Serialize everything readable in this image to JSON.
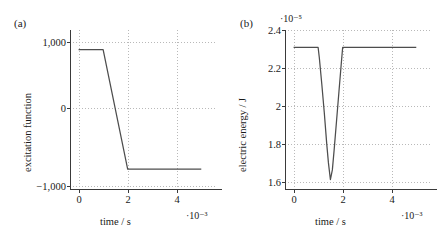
{
  "figure": {
    "background": "#ffffff",
    "line_color": "#4d4d4d",
    "axis_color": "#3a3a3a",
    "grid_color": "#b9b9b9"
  },
  "panels": [
    {
      "label": "(a)",
      "xlabel": "time / s",
      "ylabel": "excitation function",
      "x_exponent": "·10⁻³",
      "y_exponent": "",
      "xticks": [
        "0",
        "2",
        "4"
      ],
      "xtick_values": [
        0,
        2,
        4
      ],
      "yticks": [
        "1,000",
        "0",
        "−1,000"
      ],
      "ytick_values": [
        1000,
        0,
        -1000
      ]
    },
    {
      "label": "(b)",
      "xlabel": "time / s",
      "ylabel": "electric energy / J",
      "x_exponent": "·10⁻³",
      "y_exponent": "·10⁻⁵",
      "xticks": [
        "0",
        "2",
        "4"
      ],
      "xtick_values": [
        0,
        2,
        4
      ],
      "yticks": [
        "1.6",
        "1.8",
        "2",
        "2.2",
        "2.4"
      ],
      "ytick_values": [
        1.6,
        1.8,
        2.0,
        2.2,
        2.4
      ]
    }
  ],
  "chart_data": [
    {
      "type": "line",
      "title": "(a)",
      "xlabel": "time / s",
      "ylabel": "excitation function",
      "x_scale_factor": 0.001,
      "y_scale_factor": 1,
      "xlim": [
        -0.35,
        5.6
      ],
      "ylim": [
        -1350,
        1330
      ],
      "grid": true,
      "legend": "none",
      "series": [
        {
          "name": "excitation function",
          "x": [
            0.0,
            1.0,
            2.0,
            5.0
          ],
          "y": [
            1000,
            1000,
            -1000,
            -1000
          ]
        }
      ]
    },
    {
      "type": "line",
      "title": "(b)",
      "xlabel": "time / s",
      "ylabel": "electric energy / J",
      "x_scale_factor": 0.001,
      "y_scale_factor": 1e-05,
      "xlim": [
        -0.35,
        5.6
      ],
      "ylim": [
        1.515,
        2.43
      ],
      "grid": true,
      "legend": "none",
      "series": [
        {
          "name": "electric energy",
          "x": [
            0.0,
            0.45,
            0.9,
            1.0,
            1.05,
            1.15,
            1.25,
            1.35,
            1.42,
            1.5,
            1.58,
            1.65,
            1.75,
            1.85,
            1.95,
            2.0,
            2.1,
            2.6,
            3.2,
            4.0,
            5.0
          ],
          "y": [
            2.33,
            2.33,
            2.33,
            2.33,
            2.27,
            2.12,
            1.96,
            1.78,
            1.67,
            1.575,
            1.63,
            1.74,
            1.91,
            2.08,
            2.25,
            2.33,
            2.33,
            2.33,
            2.33,
            2.33,
            2.33
          ]
        }
      ]
    }
  ]
}
